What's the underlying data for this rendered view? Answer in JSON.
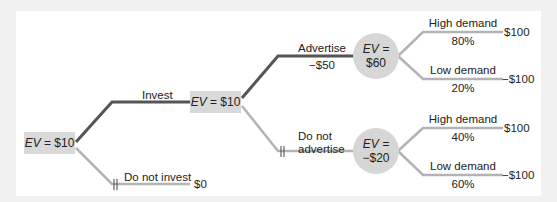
{
  "diagram": {
    "type": "decision-tree",
    "colors": {
      "chosen_path": "#555555",
      "other_path": "#b3b3b3",
      "node_fill": "#d9d9d9",
      "background": "#f1f1f1",
      "panel": "#ffffff"
    },
    "root": {
      "ev_label": "EV",
      "ev_value": "= $10"
    },
    "invest": {
      "label": "Invest",
      "node_ev_label": "EV",
      "node_ev_value": "= $10"
    },
    "do_not_invest": {
      "label": "Do not invest",
      "payoff": "$0"
    },
    "advertise": {
      "label": "Advertise",
      "cost": "−$50",
      "chance_ev_label": "EV =",
      "chance_ev_value": "$60",
      "high": {
        "label": "High demand",
        "prob": "80%",
        "payoff": "$100"
      },
      "low": {
        "label": "Low demand",
        "prob": "20%",
        "payoff": "−$100"
      }
    },
    "do_not_advertise": {
      "label_line1": "Do not",
      "label_line2": "advertise",
      "chance_ev_label": "EV =",
      "chance_ev_value": "−$20",
      "high": {
        "label": "High demand",
        "prob": "40%",
        "payoff": "$100"
      },
      "low": {
        "label": "Low demand",
        "prob": "60%",
        "payoff": "−$100"
      }
    }
  }
}
